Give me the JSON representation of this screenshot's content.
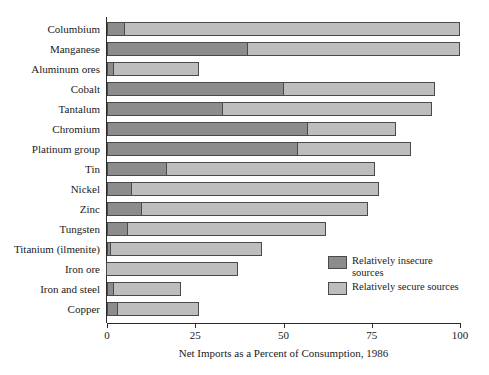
{
  "chart_data": {
    "type": "bar",
    "orientation": "horizontal",
    "stacked": true,
    "title": "",
    "xlabel": "Net Imports as a Percent of Consumption, 1986",
    "ylabel": "",
    "xlim": [
      0,
      100
    ],
    "xticks": [
      0,
      25,
      50,
      75,
      100
    ],
    "xtick_labels": [
      "0",
      "25",
      "50",
      "75",
      "100"
    ],
    "grid": false,
    "legend_position": "lower-right-inside",
    "categories": [
      "Columbium",
      "Manganese",
      "Aluminum ores",
      "Cobalt",
      "Tantalum",
      "Chromium",
      "Platinum group",
      "Tin",
      "Nickel",
      "Zinc",
      "Tungsten",
      "Titanium (ilmenite)",
      "Iron ore",
      "Iron and steel",
      "Copper"
    ],
    "series": [
      {
        "name": "Relatively insecure sources",
        "color": "#8c8c8c",
        "values": [
          5,
          40,
          2,
          50,
          33,
          57,
          54,
          17,
          7,
          10,
          6,
          1,
          0,
          2,
          3
        ]
      },
      {
        "name": "Relatively secure sources",
        "color": "#bdbdbd",
        "values": [
          95,
          60,
          24,
          43,
          59,
          25,
          32,
          59,
          70,
          64,
          56,
          43,
          37,
          19,
          23
        ]
      }
    ],
    "totals": [
      100,
      100,
      26,
      93,
      92,
      82,
      86,
      76,
      77,
      74,
      62,
      44,
      37,
      21,
      26
    ]
  },
  "legend": {
    "items": [
      {
        "label": "Relatively insecure sources",
        "swatch": "insecure-swatch"
      },
      {
        "label": "Relatively secure sources",
        "swatch": "secure-swatch"
      }
    ]
  },
  "colors": {
    "insecure": "#8c8c8c",
    "secure": "#bdbdbd",
    "axis": "#2b2b2b",
    "bar_outline": "#4a4a4a",
    "background": "#ffffff",
    "text": "#1a1a1a"
  }
}
